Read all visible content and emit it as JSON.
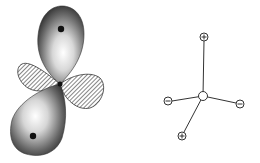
{
  "figure": {
    "panels": [
      {
        "name": "orbital-lobes",
        "description": "Shaded lobe pair (top and bottom) with dots, crossed by hatched lobe pair",
        "shaded_lobes": 2,
        "hatched_lobes": 2
      },
      {
        "name": "tetrahedral-charges",
        "center_label": "",
        "nodes": [
          {
            "position": "top",
            "sign": "+"
          },
          {
            "position": "left",
            "sign": "−"
          },
          {
            "position": "right",
            "sign": "−"
          },
          {
            "position": "bottom-left",
            "sign": "+"
          }
        ]
      }
    ],
    "colors": {
      "stroke": "#333333",
      "shade_dark": "#2a2a2a",
      "shade_light": "#ffffff",
      "hatch": "#444444",
      "background": "#ffffff"
    }
  }
}
